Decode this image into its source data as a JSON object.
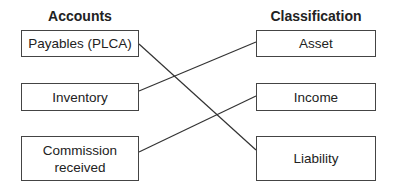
{
  "headers": {
    "left": "Accounts",
    "right": "Classification"
  },
  "accounts": [
    {
      "label": "Payables (PLCA)"
    },
    {
      "label": "Inventory"
    },
    {
      "label": "Commission received"
    }
  ],
  "classifications": [
    {
      "label": "Asset"
    },
    {
      "label": "Income"
    },
    {
      "label": "Liability"
    }
  ],
  "connections": [
    {
      "from": "Payables (PLCA)",
      "to": "Liability"
    },
    {
      "from": "Inventory",
      "to": "Asset"
    },
    {
      "from": "Commission received",
      "to": "Income"
    }
  ]
}
